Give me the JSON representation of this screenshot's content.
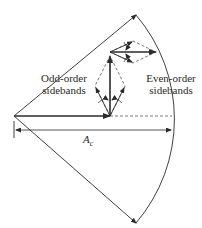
{
  "diagram": {
    "type": "phasor-diagram",
    "labels": {
      "odd_line1": "Odd-order",
      "odd_line2": "sidebands",
      "even_line1": "Even-order",
      "even_line2": "sidebands",
      "carrier_amplitude": "A",
      "carrier_amplitude_sub": "c"
    },
    "colors": {
      "line": "#2a2a2a",
      "dashed": "#555555",
      "background": "#ffffff"
    }
  }
}
